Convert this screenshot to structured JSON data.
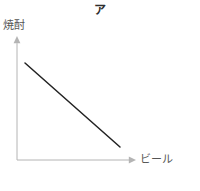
{
  "figure": {
    "title": "ア",
    "background_color": "#ffffff",
    "width": 200,
    "height": 191
  },
  "axes": {
    "y_label": "焼酎",
    "x_label": "ビール",
    "axis_color": "#b4b4b4",
    "arrowheads": "both-axes-outward",
    "origin_px": [
      17,
      160
    ],
    "y_axis_top_px": [
      17,
      38
    ],
    "x_axis_right_px": [
      135,
      160
    ]
  },
  "chart_data": {
    "type": "line",
    "title": "ア",
    "xlabel": "ビール",
    "ylabel": "焼酎",
    "grid": false,
    "legend": false,
    "tick_labels_x": [],
    "tick_labels_y": [],
    "xlim": [
      0,
      1
    ],
    "ylim": [
      0,
      1
    ],
    "annotations": [],
    "series": [
      {
        "name": "ア",
        "style": "straight-descending-line",
        "color": "#222222",
        "line_width": 1.5,
        "x": [
          0.068,
          0.873
        ],
        "y": [
          0.795,
          0.107
        ],
        "points_px": [
          [
            25,
            63
          ],
          [
            120,
            147
          ]
        ]
      }
    ]
  }
}
